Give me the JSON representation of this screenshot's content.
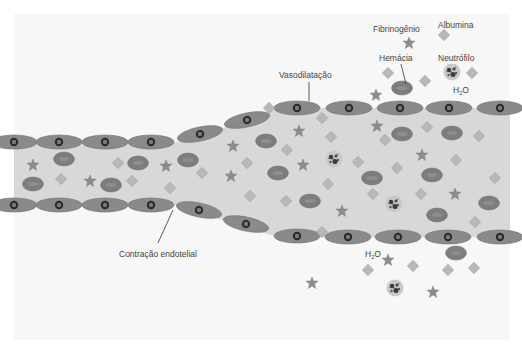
{
  "diagram": {
    "type": "vessel-inflammation-schematic",
    "colors": {
      "background": "#f7f7f7",
      "lumen": "#d8d8d8",
      "endothelial_cell": "#8a8a8a",
      "endothelial_outline": "#6e6e6e",
      "nucleus": "#2a2a2a",
      "nucleus_inner": "#7a7a7a",
      "red_cell": "#7d7d7d",
      "albumin": "#b8b8b8",
      "fibrinogen": "#8c8c8c",
      "neutrophil": "#c9c9c9",
      "text": "#444444"
    },
    "labels": {
      "fibrinogen": "Fibrinogênio",
      "albumin": "Albumina",
      "red_cell": "Hemácia",
      "neutrophil": "Neutrófilo",
      "water_top": "H",
      "water_top_sub": "2",
      "water_top_o": "O",
      "water_bottom": "H",
      "water_bottom_sub": "2",
      "water_bottom_o": "O",
      "vasodilation": "Vasodilatação",
      "endothelial_contraction": "Contração endotelial"
    },
    "legend": [
      {
        "name": "Fibrinogênio",
        "shape": "star"
      },
      {
        "name": "Albumina",
        "shape": "diamond"
      },
      {
        "name": "Hemácia",
        "shape": "ellipse"
      },
      {
        "name": "Neutrófilo",
        "shape": "granular-circle"
      }
    ]
  }
}
